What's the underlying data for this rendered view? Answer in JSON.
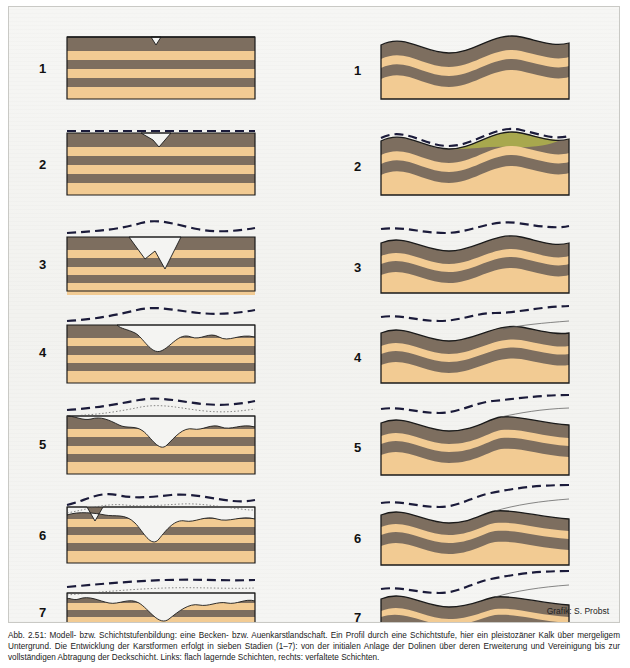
{
  "figure": {
    "stage_labels": [
      "1",
      "2",
      "3",
      "4",
      "5",
      "6",
      "7"
    ],
    "credit": "Grafik: S. Probst",
    "columns": [
      {
        "name": "left-column",
        "title": ""
      },
      {
        "name": "right-column",
        "title": ""
      }
    ]
  },
  "caption": {
    "text": "Abb. 2.51: Modell- bzw. Schichtstufenbildung: eine Becken- bzw. Auenkarstlandschaft. Ein Profil durch eine Schichtstufe, hier ein pleistozäner Kalk über mergeligem Untergrund. Die Entwicklung der Karstformen erfolgt in sieben Stadien (1–7): von der initialen Anlage der Dolinen über deren Erweiterung und Vereinigung bis zur vollständigen Abtragung der Deckschicht. Links: flach lagernde Schichten, rechts: verfaltete Schichten."
  },
  "colors": {
    "rock_dark": "#7d6e5f",
    "rock_light": "#f2cb93",
    "outline": "#1a1a1a",
    "dashed_surface": "#1b1b3a",
    "background": "#f4f4f2",
    "water": "#a8a84e"
  }
}
